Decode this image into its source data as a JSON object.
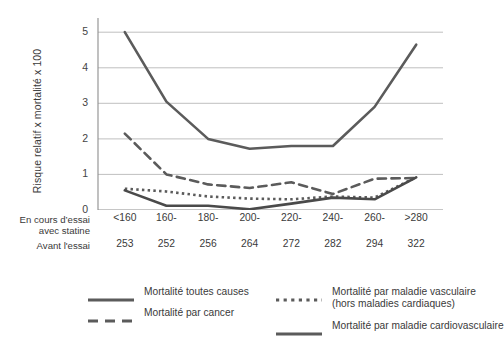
{
  "chart_data": {
    "type": "line",
    "title": "",
    "xlabel": "",
    "ylabel": "Risque relatif x mortalité x 100",
    "ylim": [
      0,
      5.4
    ],
    "yticks": [
      0,
      1,
      2,
      3,
      4,
      5
    ],
    "grid": "horizontal",
    "legend_position": "bottom",
    "categories": [
      "<160",
      "160-",
      "180-",
      "200-",
      "220-",
      "240-",
      "260-",
      ">280"
    ],
    "category_row_label": "En cours d'essai avec statine",
    "secondary_row_label": "Avant l'essai",
    "secondary_values": [
      253,
      252,
      256,
      264,
      272,
      282,
      294,
      322
    ],
    "series": [
      {
        "name": "Mortalité toutes causes",
        "style": "solid",
        "width": 2.6,
        "color": "#5b5b5b",
        "values": [
          5.0,
          3.05,
          2.0,
          1.72,
          1.8,
          1.8,
          2.9,
          4.65
        ]
      },
      {
        "name": "Mortalité par cancer",
        "style": "dashed",
        "width": 2.6,
        "color": "#5b5b5b",
        "values": [
          2.15,
          1.0,
          0.72,
          0.62,
          0.78,
          0.45,
          0.88,
          0.9
        ]
      },
      {
        "name": "Mortalité par maladie vasculaire (hors maladies cardiaques)",
        "style": "dotted",
        "width": 2.6,
        "color": "#5b5b5b",
        "values": [
          0.6,
          0.52,
          0.38,
          0.32,
          0.3,
          0.38,
          0.35,
          0.92
        ]
      },
      {
        "name": "Mortalité par maladie cardiovasculaire",
        "style": "solid",
        "width": 2.6,
        "color": "#4a4a4a",
        "values": [
          0.55,
          0.12,
          0.12,
          0.02,
          0.18,
          0.35,
          0.3,
          0.92
        ]
      }
    ]
  },
  "legend": {
    "columns": [
      [
        {
          "label": "Mortalité toutes causes",
          "style": "solid"
        },
        {
          "label": "Mortalité par cancer",
          "style": "dashed"
        }
      ],
      [
        {
          "label": "Mortalité par maladie vasculaire",
          "label2": "(hors maladies cardiaques)",
          "style": "dotted"
        },
        {
          "label": "Mortalité par maladie cardiovasculaire",
          "style": "solid"
        }
      ]
    ]
  },
  "colors": {
    "line": "#5b5b5b",
    "grid": "#b8b8b8",
    "axis": "#8d8d8d",
    "text": "#3a3a3a"
  }
}
